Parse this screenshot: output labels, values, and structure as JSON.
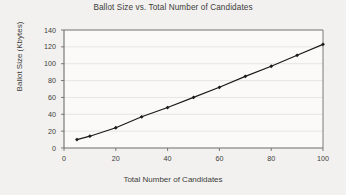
{
  "chart_data": {
    "type": "line",
    "title": "Ballot Size vs. Total Number of Candidates",
    "xlabel": "Total Number of Candidates",
    "ylabel": "Ballot Size (Kbytes)",
    "x": [
      5,
      10,
      20,
      30,
      40,
      50,
      60,
      70,
      80,
      90,
      100
    ],
    "values": [
      10,
      14,
      24,
      37,
      48,
      60,
      72,
      85,
      97,
      110,
      123
    ],
    "series": [
      {
        "name": "Ballot Size",
        "x": [
          5,
          10,
          20,
          30,
          40,
          50,
          60,
          70,
          80,
          90,
          100
        ],
        "values": [
          10,
          14,
          24,
          37,
          48,
          60,
          72,
          85,
          97,
          110,
          123
        ]
      }
    ],
    "xlim": [
      0,
      100
    ],
    "ylim": [
      0,
      140
    ],
    "xticks": [
      0,
      20,
      40,
      60,
      80,
      100
    ],
    "yticks": [
      0,
      20,
      40,
      60,
      80,
      100,
      120,
      140
    ],
    "xtick_labels": [
      "0",
      "20",
      "40",
      "60",
      "80",
      "100"
    ],
    "ytick_labels": [
      "0",
      "20",
      "40",
      "60",
      "80",
      "100",
      "120",
      "140"
    ],
    "grid": true,
    "grid_axis": "y",
    "legend": false,
    "marker": "diamond",
    "line_color": "#1a1a1a",
    "marker_color": "#1a1a1a",
    "grid_color": "#d8d7d4",
    "axis_color": "#6d6d6b",
    "plot_background": "#fbfaf8"
  }
}
